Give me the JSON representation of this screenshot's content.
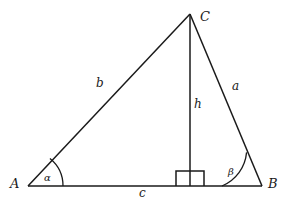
{
  "figure": {
    "type": "geometry-diagram",
    "background_color": "#ffffff",
    "stroke_color": "#1a1a1a",
    "vertices": [
      {
        "name": "A",
        "label": "A",
        "x": 28,
        "y": 186,
        "label_x": 10,
        "label_y": 179
      },
      {
        "name": "B",
        "label": "B",
        "x": 262,
        "y": 186,
        "label_x": 268,
        "label_y": 179
      },
      {
        "name": "C",
        "label": "C",
        "x": 190,
        "y": 14,
        "label_x": 200,
        "label_y": 11
      }
    ],
    "sides": [
      {
        "name": "side-b",
        "label": "b",
        "from": "A",
        "to": "C",
        "label_x": 96,
        "label_y": 78
      },
      {
        "name": "side-a",
        "label": "a",
        "from": "C",
        "to": "B",
        "label_x": 232,
        "label_y": 81
      },
      {
        "name": "side-c",
        "label": "c",
        "from": "A",
        "to": "B",
        "label_x": 139,
        "label_y": 188
      },
      {
        "name": "altitude-h",
        "label": "h",
        "from": "C",
        "to": "foot",
        "label_x": 194,
        "label_y": 99
      }
    ],
    "angles": [
      {
        "name": "angle-alpha",
        "label": "α",
        "at": "A",
        "radius": 35,
        "label_x": 44,
        "label_y": 174
      },
      {
        "name": "angle-beta",
        "label": "β",
        "at": "B",
        "radius": 40,
        "label_x": 228,
        "label_y": 168
      }
    ],
    "right_angle": {
      "name": "right-angle-marker",
      "x": 176,
      "y": 171,
      "width": 28,
      "height": 15
    },
    "foot_of_altitude": {
      "x": 190,
      "y": 186
    }
  }
}
